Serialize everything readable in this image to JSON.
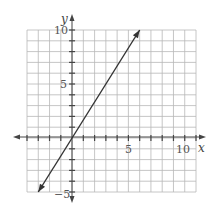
{
  "chart_data": {
    "type": "line",
    "title": "",
    "xlabel": "x",
    "ylabel": "y",
    "xlim": [
      -4,
      11
    ],
    "ylim": [
      -5,
      10
    ],
    "grid": true,
    "x_tick_labels": [
      "5",
      "10"
    ],
    "y_tick_labels": [
      "10",
      "5",
      "-5"
    ],
    "series": [
      {
        "name": "line",
        "x": [
          -3,
          0,
          6
        ],
        "y": [
          -5,
          0,
          10
        ],
        "equation": "y = (5/3)x",
        "arrows": "both"
      }
    ],
    "colors": {
      "grid": "#b5b5b5",
      "axis": "#444444",
      "line": "#333333"
    }
  },
  "labels": {
    "x_axis": "x",
    "y_axis": "y",
    "x_tick_5": "5",
    "x_tick_10": "10",
    "y_tick_10": "10",
    "y_tick_5": "5",
    "y_tick_neg5": "−5"
  }
}
